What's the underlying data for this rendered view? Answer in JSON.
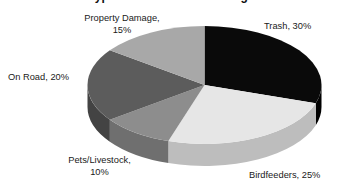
{
  "title": "Types of Black Bear Damage",
  "chart_data": {
    "type": "pie",
    "title": "Types of Black Bear Damage",
    "xlabel": "",
    "ylabel": "",
    "legend_position": "none",
    "grid": false,
    "style": "3d-pie",
    "start_angle_deg": 0,
    "direction": "clockwise",
    "categories": [
      "Trash",
      "Birdfeeders",
      "Pets/Livestock",
      "On Road",
      "Property Damage"
    ],
    "values": [
      30,
      25,
      10,
      20,
      15
    ],
    "unit": "%",
    "colors": [
      "#0a0a0a",
      "#e6e6e6",
      "#8d8d8d",
      "#5c5c5c",
      "#a8a8a8"
    ],
    "slices": [
      {
        "label": "Trash",
        "value": 30,
        "text": "Trash, 30%",
        "color": "#0a0a0a",
        "side_color": "#000000"
      },
      {
        "label": "Birdfeeders",
        "value": 25,
        "text": "Birdfeeders, 25%",
        "color": "#e6e6e6",
        "side_color": "#bdbdbd"
      },
      {
        "label": "Pets/Livestock",
        "value": 10,
        "text": "Pets/Livestock, 10%",
        "color": "#8d8d8d",
        "side_color": "#6f6f6f"
      },
      {
        "label": "On Road",
        "value": 20,
        "text": "On Road, 20%",
        "color": "#5c5c5c",
        "side_color": "#434343"
      },
      {
        "label": "Property Damage",
        "value": 15,
        "text": "Property Damage, 15%",
        "color": "#a8a8a8",
        "side_color": "#8a8a8a"
      }
    ]
  },
  "labels": {
    "property_damage_line1": "Property Damage,",
    "property_damage_line2": "15%",
    "trash": "Trash, 30%",
    "on_road": "On Road, 20%",
    "pets_livestock_line1": "Pets/Livestock,",
    "pets_livestock_line2": "10%",
    "birdfeeders": "Birdfeeders, 25%"
  }
}
